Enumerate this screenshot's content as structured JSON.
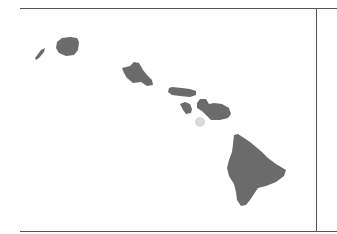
{
  "map": {
    "region": "Hawaiian Islands",
    "land_color": "#6b6b6b",
    "faint_land_color": "#d9d9d9",
    "frame_color": "#555555",
    "islands": [
      {
        "name": "Niihau"
      },
      {
        "name": "Kauai"
      },
      {
        "name": "Oahu"
      },
      {
        "name": "Molokai"
      },
      {
        "name": "Lanai"
      },
      {
        "name": "Maui"
      },
      {
        "name": "Kahoolawe"
      },
      {
        "name": "Hawaii"
      }
    ]
  }
}
